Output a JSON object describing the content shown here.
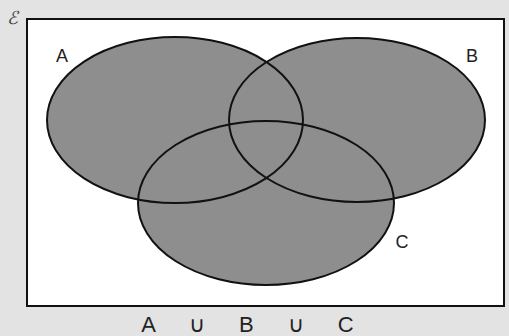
{
  "diagram": {
    "type": "venn",
    "universal_set_symbol": "ℰ",
    "sets": [
      {
        "label": "A",
        "cx": 175,
        "cy": 120,
        "rx": 128,
        "ry": 83,
        "label_x": 62,
        "label_y": 62
      },
      {
        "label": "B",
        "cx": 357,
        "cy": 120,
        "rx": 128,
        "ry": 82,
        "label_x": 472,
        "label_y": 62
      },
      {
        "label": "C",
        "cx": 266,
        "cy": 203,
        "rx": 128,
        "ry": 82,
        "label_x": 402,
        "label_y": 248
      }
    ],
    "shaded_region": "A ∪ B ∪ C",
    "caption": "A ∪ B ∪ C",
    "colors": {
      "background": "#e3e3e3",
      "universe_fill": "#ffffff",
      "shade_fill": "#8e8e8e",
      "stroke": "#111111"
    },
    "universe_rect": {
      "x": 27,
      "y": 19,
      "width": 477,
      "height": 287
    }
  }
}
